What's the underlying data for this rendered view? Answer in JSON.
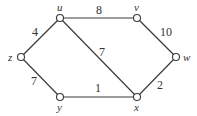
{
  "graph": {
    "type": "weighted-undirected-graph",
    "nodes": [
      {
        "id": "u",
        "label": "u",
        "x": 60,
        "y": 18,
        "lx": 57,
        "ly": 11
      },
      {
        "id": "v",
        "label": "v",
        "x": 137,
        "y": 18,
        "lx": 134,
        "ly": 11
      },
      {
        "id": "w",
        "label": "w",
        "x": 176,
        "y": 57,
        "lx": 183,
        "ly": 61
      },
      {
        "id": "z",
        "label": "z",
        "x": 21,
        "y": 57,
        "lx": 8,
        "ly": 61
      },
      {
        "id": "y",
        "label": "y",
        "x": 60,
        "y": 97,
        "lx": 57,
        "ly": 111
      },
      {
        "id": "x",
        "label": "x",
        "x": 137,
        "y": 97,
        "lx": 134,
        "ly": 111
      }
    ],
    "edges": [
      {
        "from": "u",
        "to": "v",
        "weight": "8",
        "lx": 96,
        "ly": 14
      },
      {
        "from": "v",
        "to": "w",
        "weight": "10",
        "lx": 160,
        "ly": 36
      },
      {
        "from": "u",
        "to": "z",
        "weight": "4",
        "lx": 32,
        "ly": 36
      },
      {
        "from": "u",
        "to": "x",
        "weight": "7",
        "lx": 99,
        "ly": 56
      },
      {
        "from": "z",
        "to": "y",
        "weight": "7",
        "lx": 31,
        "ly": 85
      },
      {
        "from": "y",
        "to": "x",
        "weight": "1",
        "lx": 95,
        "ly": 92
      },
      {
        "from": "x",
        "to": "w",
        "weight": "2",
        "lx": 157,
        "ly": 89
      }
    ]
  }
}
